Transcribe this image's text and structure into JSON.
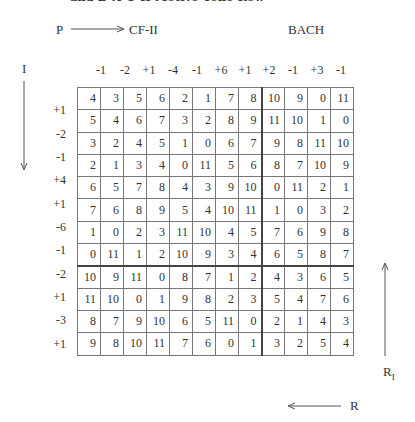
{
  "caption": "and B-A-C-H Motive Tone Row",
  "top_labels": {
    "p": "P",
    "cf": "CF-II",
    "bach": "BACH"
  },
  "side_labels": {
    "i": "I",
    "r1": "R",
    "r1_sub": "I",
    "r": "R"
  },
  "column_intervals": [
    "-1",
    "-2",
    "+1",
    "-4",
    "-1",
    "+6",
    "+1",
    "+2",
    "-1",
    "+3",
    "-1"
  ],
  "row_intervals": [
    "+1",
    "-2",
    "-1",
    "+4",
    "+1",
    "-6",
    "-1",
    "-2",
    "+1",
    "-3",
    "+1"
  ],
  "matrix": [
    [
      "4",
      "3",
      "5",
      "6",
      "2",
      "1",
      "7",
      "8",
      "10",
      "9",
      "0",
      "11"
    ],
    [
      "5",
      "4",
      "6",
      "7",
      "3",
      "2",
      "8",
      "9",
      "11",
      "10",
      "1",
      "0"
    ],
    [
      "3",
      "2",
      "4",
      "5",
      "1",
      "0",
      "6",
      "7",
      "9",
      "8",
      "11",
      "10"
    ],
    [
      "2",
      "1",
      "3",
      "4",
      "0",
      "11",
      "5",
      "6",
      "8",
      "7",
      "10",
      "9"
    ],
    [
      "6",
      "5",
      "7",
      "8",
      "4",
      "3",
      "9",
      "10",
      "0",
      "11",
      "2",
      "1"
    ],
    [
      "7",
      "6",
      "8",
      "9",
      "5",
      "4",
      "10",
      "11",
      "1",
      "0",
      "3",
      "2"
    ],
    [
      "1",
      "0",
      "2",
      "3",
      "11",
      "10",
      "4",
      "5",
      "7",
      "6",
      "9",
      "8"
    ],
    [
      "0",
      "11",
      "1",
      "2",
      "10",
      "9",
      "3",
      "4",
      "6",
      "5",
      "8",
      "7"
    ],
    [
      "10",
      "9",
      "11",
      "0",
      "8",
      "7",
      "1",
      "2",
      "4",
      "3",
      "6",
      "5"
    ],
    [
      "11",
      "10",
      "0",
      "1",
      "9",
      "8",
      "2",
      "3",
      "5",
      "4",
      "7",
      "6"
    ],
    [
      "8",
      "7",
      "9",
      "10",
      "6",
      "5",
      "11",
      "0",
      "2",
      "1",
      "4",
      "3"
    ],
    [
      "9",
      "8",
      "10",
      "11",
      "7",
      "6",
      "0",
      "1",
      "3",
      "2",
      "5",
      "4"
    ]
  ]
}
